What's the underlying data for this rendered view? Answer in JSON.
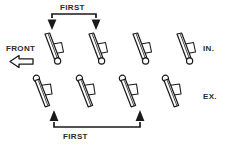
{
  "diagram": {
    "title_top": "FIRST",
    "title_bottom": "FIRST",
    "front_label": "FRONT",
    "intake_label": "IN.",
    "exhaust_label": "EX.",
    "colors": {
      "line": "#1a1a1a",
      "fill": "#ffffff",
      "background": "#ffffff",
      "text": "#2b2b2b"
    },
    "rows": [
      {
        "name": "intake-row",
        "label": "IN.",
        "orientation": "pivot-top",
        "count": 4,
        "valves": [
          {
            "index": 1,
            "x": 52,
            "marked_first": true
          },
          {
            "index": 2,
            "x": 96,
            "marked_first": true
          },
          {
            "index": 3,
            "x": 140,
            "marked_first": false
          },
          {
            "index": 4,
            "x": 184,
            "marked_first": false
          }
        ]
      },
      {
        "name": "exhaust-row",
        "label": "EX.",
        "orientation": "pivot-bottom",
        "count": 4,
        "valves": [
          {
            "index": 1,
            "x": 54,
            "marked_first": true
          },
          {
            "index": 2,
            "x": 97,
            "marked_first": false
          },
          {
            "index": 3,
            "x": 140,
            "marked_first": true
          },
          {
            "index": 4,
            "x": 183,
            "marked_first": false
          }
        ]
      }
    ],
    "brackets": [
      {
        "name": "top-first-bracket",
        "label": "FIRST",
        "from_x": 52,
        "to_x": 96,
        "direction": "down"
      },
      {
        "name": "bottom-first-bracket",
        "label": "FIRST",
        "from_x": 54,
        "to_x": 140,
        "direction": "up"
      }
    ],
    "front_arrow": {
      "direction": "left",
      "style": "hollow-block"
    }
  }
}
